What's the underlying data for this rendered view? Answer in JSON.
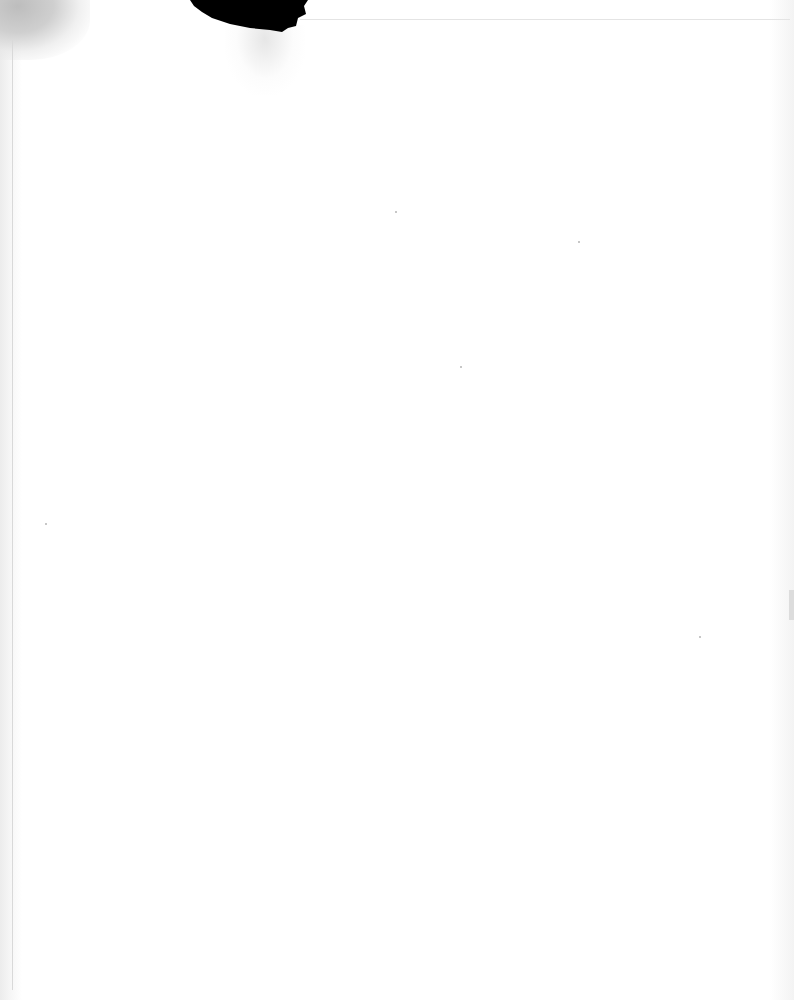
{
  "document": {
    "type": "scanned blank page",
    "text": "",
    "colors": {
      "paper": "#fdfdfd",
      "damage": "#000000",
      "stain": "#c4c4c4",
      "border": "#d9d9d9"
    }
  }
}
